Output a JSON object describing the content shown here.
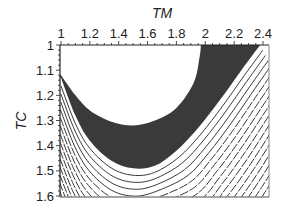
{
  "chart_data": {
    "type": "contour",
    "title": "",
    "xlabel": "TM",
    "ylabel": "TC",
    "x_axis_position": "top",
    "y_axis_inverted": true,
    "xlim": [
      1.0,
      2.4
    ],
    "ylim": [
      1.0,
      1.6
    ],
    "x_ticks": [
      "1",
      "1.2",
      "1.4",
      "1.6",
      "1.8",
      "2",
      "2.2",
      "2.4"
    ],
    "y_ticks": [
      "1",
      "1.1",
      "1.2",
      "1.3",
      "1.4",
      "1.5",
      "1.6"
    ],
    "grid": false,
    "legend": null,
    "regions": [
      {
        "name": "feasible-optimum-region",
        "fill": "#ffffff",
        "description": "White bowl-shaped region bounded by left edge (TC≈1.12), minimum near TM≈1.5, TC≈1.32, reaching top edge at TM≈1.97",
        "boundary": [
          [
            1.0,
            1.0
          ],
          [
            1.0,
            1.12
          ],
          [
            1.1,
            1.2
          ],
          [
            1.2,
            1.26
          ],
          [
            1.35,
            1.305
          ],
          [
            1.5,
            1.32
          ],
          [
            1.65,
            1.3
          ],
          [
            1.8,
            1.25
          ],
          [
            1.92,
            1.15
          ],
          [
            1.96,
            1.05
          ],
          [
            1.97,
            1.0
          ]
        ]
      },
      {
        "name": "dark-band",
        "fill": "#3a3a3a",
        "description": "Dark shaded band surrounding the white region; inner boundary = white region edge, outer boundary from left (TC≈1.13) dipping to TC≈1.49 at TM≈1.55 then rising to top-right corner (TM≈2.38, TC=1.0)",
        "outer_boundary": [
          [
            1.0,
            1.13
          ],
          [
            1.1,
            1.28
          ],
          [
            1.2,
            1.38
          ],
          [
            1.35,
            1.46
          ],
          [
            1.5,
            1.49
          ],
          [
            1.65,
            1.48
          ],
          [
            1.8,
            1.42
          ],
          [
            1.95,
            1.33
          ],
          [
            2.1,
            1.22
          ],
          [
            2.25,
            1.1
          ],
          [
            2.38,
            1.0
          ]
        ]
      }
    ],
    "contour_lines": {
      "style": "dashed",
      "color": "#222222",
      "count_lower_left": 12,
      "count_lower_right": 12,
      "description": "Concentric dashed contour lines parallel to the dark band outer boundary, filling the lower-left and lower-right areas"
    }
  }
}
